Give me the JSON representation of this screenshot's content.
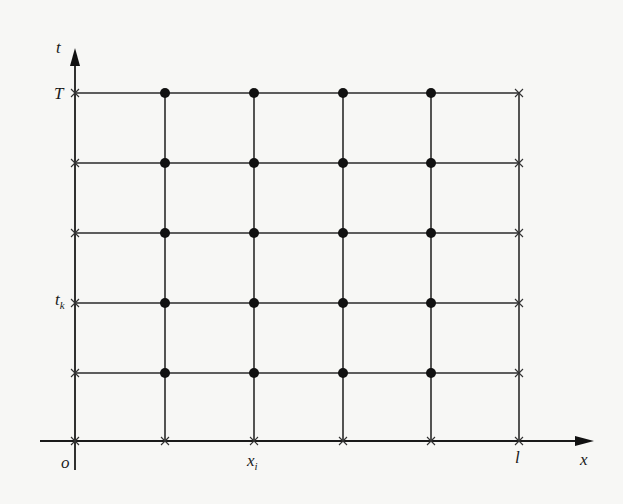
{
  "diagram": {
    "type": "finite-difference-grid",
    "axes": {
      "vertical": {
        "label": "t",
        "ticks": [
          {
            "label": "T",
            "row": 0
          },
          {
            "label": "t",
            "sub": "k",
            "row": 3
          }
        ]
      },
      "horizontal": {
        "label": "x",
        "ticks": [
          {
            "label": "x",
            "sub": "i",
            "col": 2
          },
          {
            "label": "l",
            "col": 5
          }
        ]
      },
      "origin_label": "o"
    },
    "columns_x": [
      75,
      165,
      254,
      343,
      431,
      519
    ],
    "rows_y": [
      93,
      163,
      233,
      303,
      373,
      441
    ],
    "interior_node_marker": "filled-circle",
    "boundary_node_marker": "cross",
    "colors": {
      "line": "#2a2a2a",
      "node": "#111111",
      "background": "#f7f7f5"
    }
  },
  "labels": {
    "t_axis": "t",
    "x_axis": "x",
    "T": "T",
    "tk_main": "t",
    "tk_sub": "k",
    "xi_main": "x",
    "xi_sub": "i",
    "l": "l",
    "origin": "o"
  }
}
